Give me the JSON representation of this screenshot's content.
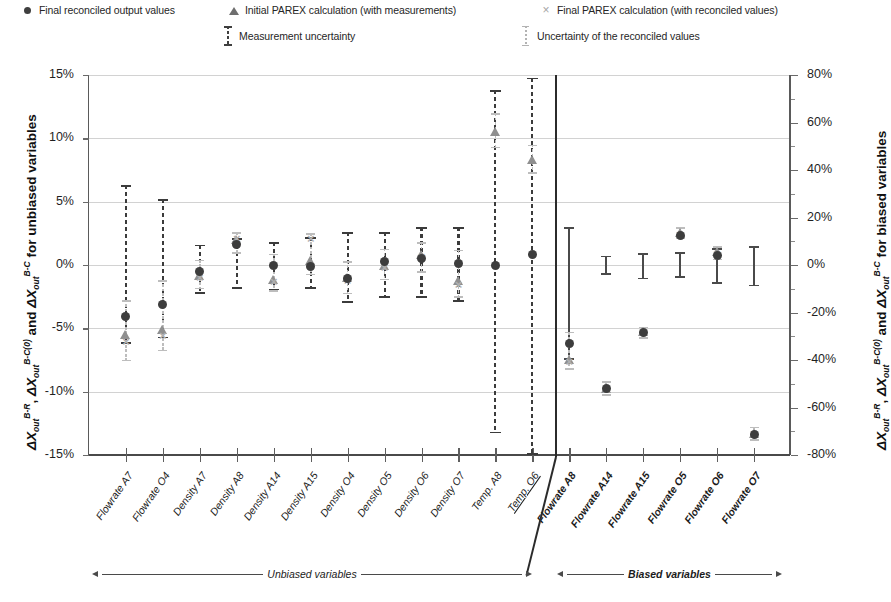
{
  "legend": {
    "items": [
      {
        "marker": "circle-marker",
        "label": "Final reconciled output values"
      },
      {
        "marker": "triangle-marker",
        "label": "Initial PAREX calculation (with measurements)"
      },
      {
        "marker": "x-marker",
        "label": "Final PAREX calculation (with reconciled values)"
      },
      {
        "marker": "errorbar-dark-dashed",
        "label": "Measurement uncertainty"
      },
      {
        "marker": "errorbar-light-dotted",
        "label": "Uncertainty of the reconciled values"
      }
    ]
  },
  "axes": {
    "left_title_parts": {
      "p1": "ΔX",
      "s1": "out",
      "u1": "B-R",
      "p2": ", ΔX",
      "s2": "out",
      "u2": "B-C(0)",
      "p3": " and ΔX",
      "s3": "out",
      "u3": "B-C",
      "p4": " for unbiased variables"
    },
    "right_title_parts": {
      "p1": "ΔX",
      "s1": "out",
      "u1": "B-R",
      "p2": ", ΔX",
      "s2": "out",
      "u2": "B-C(0)",
      "p3": " and ΔX",
      "s3": "out",
      "u3": "B-C",
      "p4": " for biased variables"
    },
    "left_ticks": [
      "15%",
      "10%",
      "5%",
      "0%",
      "-5%",
      "-10%",
      "-15%"
    ],
    "right_ticks": [
      "80%",
      "60%",
      "40%",
      "20%",
      "0%",
      "-20%",
      "-40%",
      "-60%",
      "-80%"
    ],
    "left_range": [
      -15,
      15
    ],
    "right_range": [
      -80,
      80
    ]
  },
  "annotations": {
    "unbiased": "Unbiased variables",
    "biased": "Biased variables"
  },
  "chart_data": {
    "type": "scatter",
    "title": "",
    "xlabel": "",
    "ylabel": "ΔX_out^B-R , ΔX_out^B-C(0) and ΔX_out^B-C for unbiased variables",
    "ylabel_right": "ΔX_out^B-R , ΔX_out^B-C(0) and ΔX_out^B-C for biased variables",
    "ylim": [
      -15,
      15
    ],
    "ylim_right": [
      -80,
      80
    ],
    "grid": true,
    "legend_position": "top",
    "categories": [
      "Flowrate A7",
      "Flowrate O4",
      "Density A7",
      "Density A8",
      "Density A14",
      "Density A15",
      "Density O4",
      "Density O5",
      "Density O6",
      "Density O7",
      "Temp. A8",
      "Temp. O6",
      "Flowrate A8",
      "Flowrate A14",
      "Flowrate A15",
      "Flowrate O5",
      "Flowrate O6",
      "Flowrate O7"
    ],
    "group_split_after_index": 11,
    "groups": [
      {
        "name": "Unbiased variables",
        "axis": "left",
        "categories_from": 0,
        "categories_to": 11
      },
      {
        "name": "Biased variables",
        "axis": "right",
        "categories_from": 12,
        "categories_to": 17
      }
    ],
    "series": [
      {
        "name": "Final reconciled output values",
        "marker": "circle",
        "values": [
          -4.1,
          -3.1,
          -0.5,
          1.6,
          0.0,
          -0.1,
          -1.1,
          0.3,
          0.5,
          0.1,
          0.0,
          0.8,
          -33.0,
          -52.0,
          -28.5,
          12.5,
          4.0,
          -71.5
        ]
      },
      {
        "name": "Initial PAREX calculation (with measurements)",
        "marker": "triangle",
        "values": [
          -5.5,
          -5.1,
          -0.9,
          2.0,
          -1.2,
          0.3,
          -1.0,
          -0.1,
          0.8,
          -1.3,
          10.5,
          8.3,
          -40.0,
          -52.0,
          -28.0,
          13.5,
          5.5,
          -71.0
        ]
      },
      {
        "name": "Final PAREX calculation (with reconciled values)",
        "marker": "x",
        "values": [
          -6.0,
          -5.6,
          -1.0,
          2.1,
          -1.3,
          2.1,
          -1.2,
          -0.2,
          0.7,
          -1.5,
          null,
          null,
          -40.5,
          -52.5,
          -28.5,
          13.0,
          5.0,
          -71.0
        ]
      }
    ],
    "measurement_uncertainty": [
      {
        "category": "Flowrate A7",
        "lo": -6.2,
        "hi": 6.3
      },
      {
        "category": "Flowrate O4",
        "lo": -5.8,
        "hi": 5.2
      },
      {
        "category": "Density A7",
        "lo": -2.3,
        "hi": 1.6
      },
      {
        "category": "Density A8",
        "lo": -1.9,
        "hi": 2.1
      },
      {
        "category": "Density A14",
        "lo": -2.0,
        "hi": 1.8
      },
      {
        "category": "Density A15",
        "lo": -1.9,
        "hi": 2.2
      },
      {
        "category": "Density O4",
        "lo": -3.0,
        "hi": 2.6
      },
      {
        "category": "Density O5",
        "lo": -2.6,
        "hi": 2.6
      },
      {
        "category": "Density O6",
        "lo": -2.6,
        "hi": 3.0
      },
      {
        "category": "Density O7",
        "lo": -2.9,
        "hi": 3.0
      },
      {
        "category": "Temp. A8",
        "lo": -13.3,
        "hi": 13.8
      },
      {
        "category": "Temp. O6",
        "lo": -15.0,
        "hi": 14.8
      },
      {
        "category": "Flowrate A8",
        "lo": -40.0,
        "hi": 16.0
      },
      {
        "category": "Flowrate A14",
        "lo": -4.0,
        "hi": 4.0
      },
      {
        "category": "Flowrate A15",
        "lo": -6.0,
        "hi": 5.0
      },
      {
        "category": "Flowrate O5",
        "lo": -5.5,
        "hi": 5.5
      },
      {
        "category": "Flowrate O6",
        "lo": -8.0,
        "hi": 7.0
      },
      {
        "category": "Flowrate O7",
        "lo": -9.0,
        "hi": 8.0
      }
    ],
    "reconciled_uncertainty": [
      {
        "category": "Flowrate A7",
        "lo": -7.6,
        "hi": -2.8
      },
      {
        "category": "Flowrate O4",
        "lo": -6.8,
        "hi": -1.2
      },
      {
        "category": "Density A7",
        "lo": -1.9,
        "hi": 0.4
      },
      {
        "category": "Density A8",
        "lo": 0.9,
        "hi": 2.6
      },
      {
        "category": "Density A14",
        "lo": -2.1,
        "hi": 0.9
      },
      {
        "category": "Density A15",
        "lo": -0.8,
        "hi": 2.5
      },
      {
        "category": "Density O4",
        "lo": -2.3,
        "hi": 0.3
      },
      {
        "category": "Density O5",
        "lo": -1.2,
        "hi": 1.3
      },
      {
        "category": "Density O6",
        "lo": -0.6,
        "hi": 1.8
      },
      {
        "category": "Density O7",
        "lo": -2.6,
        "hi": 1.2
      },
      {
        "category": "Temp. A8",
        "lo": 9.2,
        "hi": 12.0
      },
      {
        "category": "Temp. O6",
        "lo": 7.2,
        "hi": 9.5
      },
      {
        "category": "Flowrate A8",
        "lo": -44.0,
        "hi": -28.0
      },
      {
        "category": "Flowrate A14",
        "lo": -55.0,
        "hi": -49.0
      },
      {
        "category": "Flowrate A15",
        "lo": -31.0,
        "hi": -26.0
      },
      {
        "category": "Flowrate O5",
        "lo": 11.0,
        "hi": 16.0
      },
      {
        "category": "Flowrate O6",
        "lo": 2.0,
        "hi": 8.0
      },
      {
        "category": "Flowrate O7",
        "lo": -74.0,
        "hi": -68.0
      }
    ]
  }
}
